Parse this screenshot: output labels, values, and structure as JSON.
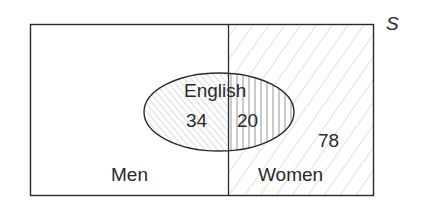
{
  "diagram": {
    "type": "venn",
    "universe_label": "S",
    "regions": {
      "men": "Men",
      "women": "Women",
      "english": "English"
    },
    "counts": {
      "men_english": "34",
      "women_english": "20",
      "women_not_english": "78"
    }
  }
}
